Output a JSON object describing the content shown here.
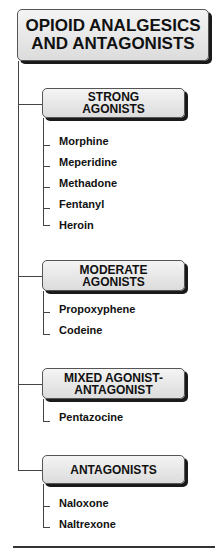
{
  "title": [
    "OPIOID ANALGESICS",
    "AND ANTAGONISTS"
  ],
  "categories": [
    {
      "label": [
        "STRONG",
        "AGONISTS"
      ],
      "items": [
        "Morphine",
        "Meperidine",
        "Methadone",
        "Fentanyl",
        "Heroin"
      ]
    },
    {
      "label": [
        "MODERATE",
        "AGONISTS"
      ],
      "items": [
        "Propoxyphene",
        "Codeine"
      ]
    },
    {
      "label": [
        "MIXED AGONIST-",
        "ANTAGONIST"
      ],
      "items": [
        "Pentazocine"
      ]
    },
    {
      "label": [
        "ANTAGONISTS"
      ],
      "items": [
        "Naloxone",
        "Naltrexone"
      ]
    }
  ]
}
